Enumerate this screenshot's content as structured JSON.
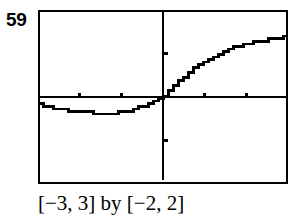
{
  "figure": {
    "number": "59",
    "caption": "[−3, 3] by [−2, 2]"
  },
  "chart_data": {
    "type": "line",
    "title": "",
    "xlabel": "",
    "ylabel": "",
    "xlim": [
      -3,
      3
    ],
    "ylim": [
      -2,
      2
    ],
    "xticks": [
      -2,
      -1,
      1,
      2
    ],
    "yticks": [
      -1,
      1
    ],
    "grid": false,
    "legend": null,
    "axes_style": "calculator-viewing-window",
    "frame": true,
    "series": [
      {
        "name": "y",
        "style": "pixelated-staircase",
        "color": "#000000",
        "x": [
          -3.0,
          -2.75,
          -2.5,
          -2.25,
          -2.0,
          -1.75,
          -1.5,
          -1.25,
          -1.0,
          -0.9,
          -0.8,
          -0.7,
          -0.6,
          -0.5,
          -0.4,
          -0.3,
          -0.2,
          -0.1,
          0.0,
          0.1,
          0.2,
          0.3,
          0.4,
          0.5,
          0.6,
          0.7,
          0.8,
          0.9,
          1.0,
          1.25,
          1.5,
          1.75,
          2.0,
          2.25,
          2.5,
          2.75,
          3.0
        ],
        "y": [
          -0.16,
          -0.21,
          -0.26,
          -0.31,
          -0.34,
          -0.36,
          -0.37,
          -0.37,
          -0.36,
          -0.34,
          -0.32,
          -0.29,
          -0.26,
          -0.22,
          -0.18,
          -0.14,
          -0.1,
          -0.05,
          0.0,
          0.09,
          0.18,
          0.27,
          0.36,
          0.44,
          0.52,
          0.6,
          0.67,
          0.74,
          0.8,
          0.94,
          1.05,
          1.14,
          1.21,
          1.27,
          1.32,
          1.36,
          1.4
        ]
      }
    ]
  },
  "icons": {
    "plot_area": "graph-plot-icon"
  },
  "colors": {
    "ink": "#000000",
    "background": "#ffffff"
  }
}
